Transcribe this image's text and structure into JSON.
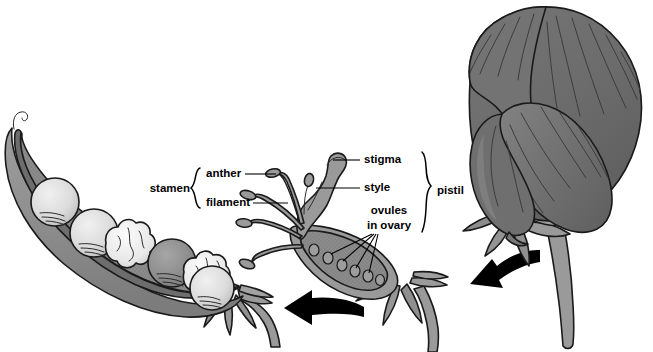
{
  "figure": {
    "background_color": "#ffffff",
    "width": 653,
    "height": 352
  },
  "labels": {
    "stamen": "stamen",
    "anther": "anther",
    "filament": "filament",
    "stigma": "stigma",
    "style": "style",
    "ovules_line1": "ovules",
    "ovules_line2": "in ovary",
    "pistil": "pistil"
  },
  "colors": {
    "outline": "#1a1a1a",
    "petal": "#6e6e6e",
    "petal_shade": "#5f5f5f",
    "petal_light": "#7b7b7b",
    "pod_wall": "#8d8d8d",
    "pod_inner": "#828282",
    "pod_rim": "#9b9b9b",
    "seed_light": "#d9d9d9",
    "seed_dark": "#8f8f8f",
    "seed_wrinkled": "#e6e6e6",
    "stem": "#9a9a9a",
    "sepal": "#8a8a8a",
    "pistil_body": "#9a9a9a",
    "stamen_body": "#9a9a9a",
    "arrow": "#000000",
    "text": "#000000"
  },
  "panels": [
    {
      "name": "open-pod",
      "description": "Longitudinal section of a mature pea pod showing seeds inside",
      "seed_count": 6,
      "seeds": [
        {
          "index": 1,
          "type": "round",
          "shade": "light"
        },
        {
          "index": 2,
          "type": "round",
          "shade": "light"
        },
        {
          "index": 3,
          "type": "wrinkled",
          "shade": "white"
        },
        {
          "index": 4,
          "type": "round",
          "shade": "dark"
        },
        {
          "index": 5,
          "type": "wrinkled",
          "shade": "white"
        },
        {
          "index": 6,
          "type": "round",
          "shade": "light"
        }
      ]
    },
    {
      "name": "dissected-flower",
      "description": "Flower with petals removed showing stamens and pistil",
      "stamen_count": 4,
      "ovule_count": 6
    },
    {
      "name": "intact-flower",
      "description": "Whole pea blossom with banner, wing and keel petals"
    }
  ],
  "arrows": [
    {
      "name": "arrow-flower-to-dissection",
      "direction": "left"
    },
    {
      "name": "arrow-dissection-to-pod",
      "direction": "left"
    }
  ]
}
